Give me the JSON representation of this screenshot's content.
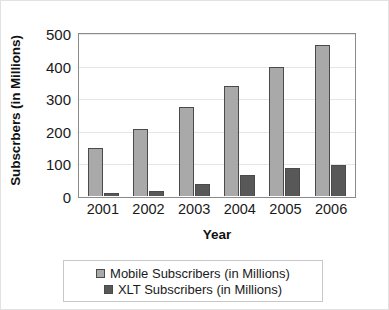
{
  "chart_data": {
    "type": "bar",
    "title": "",
    "xlabel": "Year",
    "ylabel": "Subscrbers (in Millions)",
    "categories": [
      "2001",
      "2002",
      "2003",
      "2004",
      "2005",
      "2006"
    ],
    "series": [
      {
        "name": "Mobile Subscribers (in Millions)",
        "color": "#a9a9a9",
        "values": [
          148,
          207,
          272,
          337,
          397,
          462
        ]
      },
      {
        "name": "XLT Subscribers (in Millions)",
        "color": "#585858",
        "values": [
          8,
          14,
          36,
          65,
          85,
          95
        ]
      }
    ],
    "ylim": [
      0,
      500
    ],
    "yticks": [
      0,
      100,
      200,
      300,
      400,
      500
    ],
    "ytick_labels": [
      "0",
      "100",
      "200",
      "300",
      "400",
      "500"
    ],
    "grid": true,
    "legend_position": "bottom"
  }
}
